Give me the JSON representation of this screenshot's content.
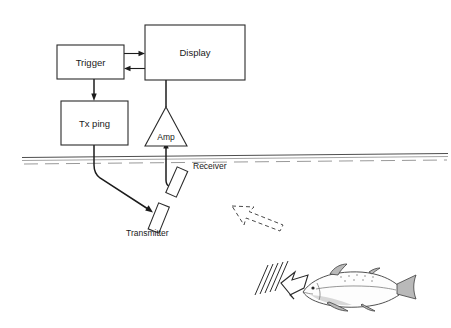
{
  "figure": {
    "kind": "echosounder-block-diagram",
    "background_color": "#ffffff",
    "line_color": "#1c1c1c",
    "width": 451,
    "height": 328
  },
  "blocks": {
    "trigger": {
      "label": "Trigger"
    },
    "display": {
      "label": "Display"
    },
    "tx_ping": {
      "label": "Tx ping"
    },
    "amp": {
      "label": "Amp"
    }
  },
  "transducers": {
    "transmitter": {
      "label": "Transmitter"
    },
    "receiver": {
      "label": "Receiver"
    }
  },
  "water": {
    "surface_label": "",
    "surface_color": "#3a3a3a"
  },
  "acoustics": {
    "outgoing_ping": {
      "name": "ping-arrow",
      "style": "solid-outline"
    },
    "returning_echo": {
      "name": "echo-arrow",
      "style": "dashed-outline"
    },
    "wavefronts": {
      "count": 5
    }
  },
  "target": {
    "name": "fish",
    "facing": "left"
  }
}
